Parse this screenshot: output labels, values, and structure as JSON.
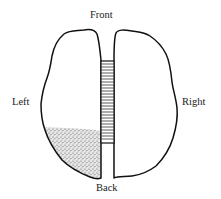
{
  "diagram": {
    "type": "brain-top-view",
    "labels": {
      "front": "Front",
      "back": "Back",
      "left": "Left",
      "right": "Right"
    },
    "regions": [
      {
        "name": "left-hemisphere",
        "shaded": "back-portion"
      },
      {
        "name": "corpus-callosum",
        "pattern": "horizontal-stripes"
      },
      {
        "name": "right-hemisphere",
        "shaded": "none"
      }
    ],
    "colors": {
      "stroke": "#111111",
      "background": "#ffffff",
      "stipple": "#555555"
    }
  }
}
